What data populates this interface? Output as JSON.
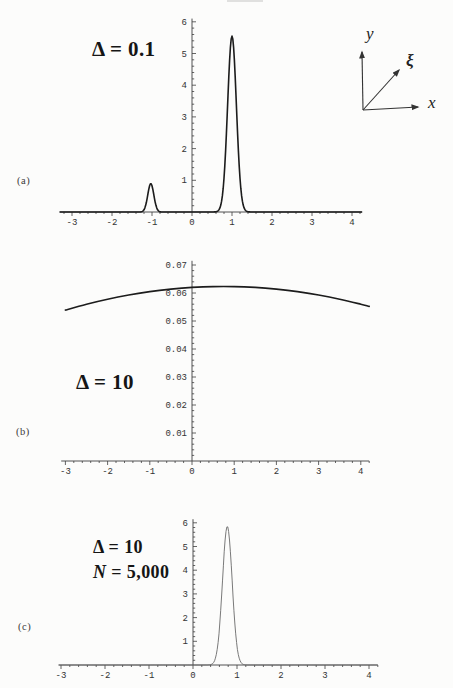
{
  "figure": {
    "background": "#fcfcfb",
    "axis_color": "#3f3f3f",
    "tick_label_color": "#333333",
    "curve_color_dark": "#1c1c1c",
    "curve_color_light": "#6a6a6a"
  },
  "inset": {
    "y_label": "y",
    "xi_label": "ξ",
    "x_label": "x"
  },
  "chart_data": [
    {
      "id": "a",
      "type": "line",
      "panel_label": "(a)",
      "annotation": "Δ = 0.1",
      "title": "",
      "xlabel": "",
      "ylabel": "",
      "grid": false,
      "legend": "none",
      "xlim": [
        -3.3,
        4.25
      ],
      "ylim": [
        0,
        6.1
      ],
      "x_ticks": [
        -3,
        -2,
        -1,
        0,
        1,
        2,
        3,
        4
      ],
      "x_tick_labels": [
        "-3",
        "-2",
        "-1",
        "0",
        "1",
        "2",
        "3",
        "4"
      ],
      "y_ticks": [
        1,
        2,
        3,
        4,
        5,
        6
      ],
      "y_tick_labels": [
        "1",
        "2",
        "3",
        "4",
        "5",
        "6"
      ],
      "series": [
        {
          "name": "probability density",
          "kind": "gaussian_peaks",
          "peaks": [
            {
              "center": -1.03,
              "height": 0.9,
              "sigma": 0.075
            },
            {
              "center": 1.0,
              "height": 5.55,
              "sigma": 0.11
            }
          ]
        }
      ]
    },
    {
      "id": "b",
      "type": "line",
      "panel_label": "(b)",
      "annotation": "Δ = 10",
      "title": "",
      "xlabel": "",
      "ylabel": "",
      "grid": false,
      "legend": "none",
      "xlim": [
        -3.1,
        4.2
      ],
      "ylim": [
        0,
        0.0715
      ],
      "x_ticks": [
        -3,
        -2,
        -1,
        0,
        1,
        2,
        3,
        4
      ],
      "x_tick_labels": [
        "-3",
        "-2",
        "-1",
        "0",
        "1",
        "2",
        "3",
        "4"
      ],
      "y_ticks": [
        0.01,
        0.02,
        0.03,
        0.04,
        0.05,
        0.06,
        0.07
      ],
      "y_tick_labels": [
        "0.01",
        "0.02",
        "0.03",
        "0.04",
        "0.05",
        "0.06",
        "0.07"
      ],
      "series": [
        {
          "name": "probability density",
          "kind": "points",
          "points": [
            [
              -3.0,
              0.0539
            ],
            [
              -2.5,
              0.056
            ],
            [
              -2.0,
              0.0578
            ],
            [
              -1.5,
              0.0593
            ],
            [
              -1.0,
              0.0605
            ],
            [
              -0.5,
              0.0614
            ],
            [
              0.0,
              0.062
            ],
            [
              0.5,
              0.0623
            ],
            [
              1.0,
              0.0623
            ],
            [
              1.5,
              0.062
            ],
            [
              2.0,
              0.0614
            ],
            [
              2.5,
              0.0605
            ],
            [
              3.0,
              0.0593
            ],
            [
              3.5,
              0.0578
            ],
            [
              4.0,
              0.056
            ],
            [
              4.2,
              0.0552
            ]
          ]
        }
      ]
    },
    {
      "id": "c",
      "type": "line",
      "panel_label": "(c)",
      "annotation": "Δ = 10",
      "annotation_line2_var": "N",
      "annotation_line2_rest": " = 5,000",
      "title": "",
      "xlabel": "",
      "ylabel": "",
      "grid": false,
      "legend": "none",
      "xlim": [
        -3.05,
        4.2
      ],
      "ylim": [
        0,
        6.15
      ],
      "x_ticks": [
        -3,
        -2,
        -1,
        0,
        1,
        2,
        3,
        4
      ],
      "x_tick_labels": [
        "-3",
        "-2",
        "-1",
        "0",
        "1",
        "2",
        "3",
        "4"
      ],
      "y_ticks": [
        1,
        2,
        3,
        4,
        5,
        6
      ],
      "y_tick_labels": [
        "1",
        "2",
        "3",
        "4",
        "5",
        "6"
      ],
      "series": [
        {
          "name": "probability density",
          "kind": "gaussian_peaks",
          "peaks": [
            {
              "center": 0.78,
              "height": 5.85,
              "sigma": 0.11
            }
          ]
        }
      ]
    }
  ]
}
